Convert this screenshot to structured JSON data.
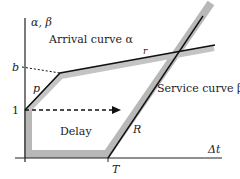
{
  "diagram": {
    "axes": {
      "y_label": "α, β",
      "x_label": "Δt",
      "y_tick_b": "b",
      "y_tick_1": "1",
      "x_tick_T": "T"
    },
    "curves": {
      "arrival": {
        "label": "Arrival curve α",
        "slope_label_initial": "p",
        "slope_label_long": "r"
      },
      "service": {
        "label": "Service curve β",
        "slope_label": "R"
      }
    },
    "region": {
      "label": "Delay"
    },
    "colors": {
      "axis": "#222222",
      "curve": "#111111",
      "service_band": "#b8b8b8",
      "background": "#ffffff"
    }
  }
}
